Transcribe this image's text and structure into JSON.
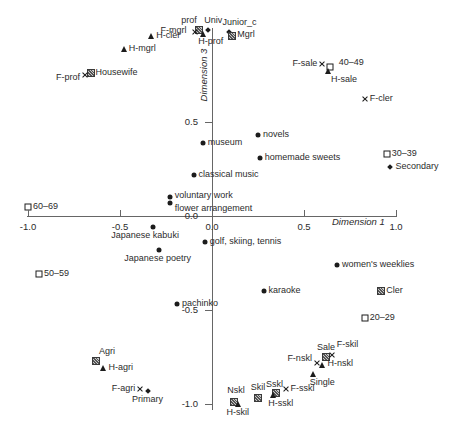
{
  "colors": {
    "background": "#ffffff",
    "axis": "#666666",
    "marker": "#1c1c1c",
    "text": "#2b2b2b"
  },
  "chart_data": {
    "type": "scatter",
    "title": "",
    "xlabel": "Dimension 1",
    "ylabel": "Dimension 3",
    "xlim": [
      -1.0,
      1.0
    ],
    "ylim": [
      -1.05,
      1.0
    ],
    "grid": false,
    "legend": false,
    "x_ticks": [
      {
        "v": -1.0,
        "label": "-1.0"
      },
      {
        "v": -0.5,
        "label": "-0.5"
      },
      {
        "v": 0.0,
        "label": "0.0"
      },
      {
        "v": 0.5,
        "label": "0.5"
      },
      {
        "v": 1.0,
        "label": "1.0"
      }
    ],
    "y_ticks": [
      {
        "v": 0.5,
        "label": "0.5"
      },
      {
        "v": 0.0,
        "label": "0.0"
      },
      {
        "v": -0.5,
        "label": "-0.5"
      },
      {
        "v": -1.0,
        "label": "-1.0"
      }
    ],
    "series": [
      {
        "name": "leisure-activities",
        "marker": "circle",
        "points": [
          {
            "label": "museum",
            "x": -0.05,
            "y": 0.39,
            "lp": "right"
          },
          {
            "label": "novels",
            "x": 0.25,
            "y": 0.43,
            "lp": "right"
          },
          {
            "label": "homemade sweets",
            "x": 0.26,
            "y": 0.31,
            "lp": "right"
          },
          {
            "label": "classical music",
            "x": -0.1,
            "y": 0.22,
            "lp": "right"
          },
          {
            "label": "voluntary work",
            "x": -0.23,
            "y": 0.1,
            "lp": "right",
            "ldy": -1
          },
          {
            "label": "flower arrangement",
            "x": -0.23,
            "y": 0.07,
            "lp": "right",
            "ldy": 6
          },
          {
            "label": "Japanese kabuki",
            "x": -0.32,
            "y": -0.06,
            "lp": "below",
            "ldx": -8
          },
          {
            "label": "Japanese poetry",
            "x": -0.29,
            "y": -0.18,
            "lp": "below",
            "ldx": -1
          },
          {
            "label": "golf, skiing, tennis",
            "x": -0.04,
            "y": -0.14,
            "lp": "right"
          },
          {
            "label": "pachinko",
            "x": -0.19,
            "y": -0.47,
            "lp": "right"
          },
          {
            "label": "karaoke",
            "x": 0.28,
            "y": -0.4,
            "lp": "right"
          },
          {
            "label": "women's weeklies",
            "x": 0.68,
            "y": -0.26,
            "lp": "right"
          }
        ]
      },
      {
        "name": "age-groups",
        "marker": "open-square",
        "points": [
          {
            "label": "20–29",
            "x": 0.83,
            "y": -0.54,
            "lp": "right"
          },
          {
            "label": "30–39",
            "x": 0.95,
            "y": 0.33,
            "lp": "right"
          },
          {
            "label": "40–49",
            "x": 0.64,
            "y": 0.79,
            "lp": "right",
            "ldx": 4,
            "ldy": -4
          },
          {
            "label": "50–59",
            "x": -0.94,
            "y": -0.31,
            "lp": "right"
          },
          {
            "label": "60–69",
            "x": -1.0,
            "y": 0.05,
            "lp": "right"
          }
        ]
      },
      {
        "name": "education-levels",
        "marker": "diamond",
        "points": [
          {
            "label": "Primary",
            "x": -0.35,
            "y": -0.93,
            "lp": "below"
          },
          {
            "label": "Secondary",
            "x": 0.97,
            "y": 0.26,
            "lp": "right"
          },
          {
            "label": "Junior_c",
            "x": 0.09,
            "y": 0.98,
            "lp": "above",
            "ldx": 11
          },
          {
            "label": "Univ",
            "x": -0.02,
            "y": 0.99,
            "lp": "above",
            "ldx": 5
          }
        ]
      },
      {
        "name": "occupation-classes",
        "marker": "hatch-square",
        "points": [
          {
            "label": "prof",
            "x": -0.07,
            "y": 0.99,
            "lp": "above",
            "ldx": -10
          },
          {
            "label": "Mgrl",
            "x": 0.11,
            "y": 0.96,
            "lp": "right",
            "ldy": -1
          },
          {
            "label": "Cler",
            "x": 0.92,
            "y": -0.4,
            "lp": "right"
          },
          {
            "label": "Sale",
            "x": 0.62,
            "y": -0.75,
            "lp": "above"
          },
          {
            "label": "Skil",
            "x": 0.25,
            "y": -0.97,
            "lp": "above",
            "ldy": -1
          },
          {
            "label": "Sskl",
            "x": 0.35,
            "y": -0.94,
            "lp": "above",
            "ldx": -2,
            "ldy": 1
          },
          {
            "label": "Nskl",
            "x": 0.12,
            "y": -0.99,
            "lp": "above",
            "ldx": 2,
            "ldy": -2
          },
          {
            "label": "Agri",
            "x": -0.63,
            "y": -0.77,
            "lp": "above",
            "ldx": 11
          },
          {
            "label": "Housewife",
            "x": -0.66,
            "y": 0.76,
            "lp": "right"
          }
        ]
      },
      {
        "name": "husband-occupations",
        "marker": "triangle",
        "points": [
          {
            "label": "H-prof",
            "x": -0.05,
            "y": 0.97,
            "lp": "below",
            "ldx": 8,
            "ldy": -1
          },
          {
            "label": "H-mgrl",
            "x": -0.48,
            "y": 0.89,
            "lp": "right"
          },
          {
            "label": "H-cler",
            "x": -0.33,
            "y": 0.96,
            "lp": "right"
          },
          {
            "label": "H-sale",
            "x": 0.63,
            "y": 0.77,
            "lp": "below",
            "ldx": 16
          },
          {
            "label": "H-agri",
            "x": -0.59,
            "y": -0.81,
            "lp": "right"
          },
          {
            "label": "H-skil",
            "x": 0.14,
            "y": -1.0,
            "lp": "below"
          },
          {
            "label": "H-sskl",
            "x": 0.33,
            "y": -0.95,
            "lp": "below",
            "ldx": 8
          },
          {
            "label": "H-nskl",
            "x": 0.6,
            "y": -0.79,
            "lp": "right",
            "ldy": -1
          },
          {
            "label": "Single",
            "x": 0.55,
            "y": -0.84,
            "lp": "below",
            "ldx": 9
          }
        ]
      },
      {
        "name": "female-occupations",
        "marker": "x",
        "points": [
          {
            "label": "F-prof",
            "x": -0.69,
            "y": 0.75,
            "lp": "left",
            "ldy": 3
          },
          {
            "label": "F-mgrl",
            "x": -0.09,
            "y": 0.98,
            "lp": "left",
            "ldx": -4,
            "ldy": -1
          },
          {
            "label": "F-cler",
            "x": 0.83,
            "y": 0.62,
            "lp": "right"
          },
          {
            "label": "F-sale",
            "x": 0.6,
            "y": 0.81,
            "lp": "left"
          },
          {
            "label": "F-agri",
            "x": -0.39,
            "y": -0.92,
            "lp": "left"
          },
          {
            "label": "F-skil",
            "x": 0.65,
            "y": -0.74,
            "lp": "above",
            "ldx": 16,
            "ldy": -1
          },
          {
            "label": "F-sskl",
            "x": 0.4,
            "y": -0.92,
            "lp": "right"
          },
          {
            "label": "F-nskl",
            "x": 0.57,
            "y": -0.78,
            "lp": "left",
            "ldy": -4
          }
        ]
      }
    ]
  }
}
